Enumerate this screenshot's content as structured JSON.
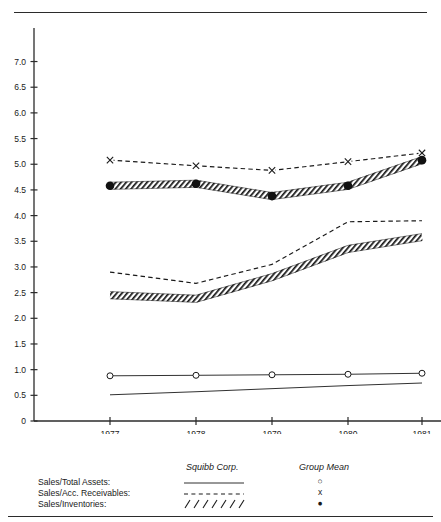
{
  "chart_data": {
    "type": "line",
    "title": "",
    "xlabel": "",
    "ylabel": "",
    "x": [
      "1977",
      "1978",
      "1979",
      "1980",
      "1981"
    ],
    "ylim": [
      0,
      7.4
    ],
    "yticks": [
      "0",
      "0.5",
      "1.0",
      "1.5",
      "2.0",
      "2.5",
      "3.0",
      "3.5",
      "4.0",
      "4.5",
      "5.0",
      "5.5",
      "6.0",
      "6.5",
      "7.0"
    ],
    "ytick_values": [
      0,
      0.5,
      1.0,
      1.5,
      2.0,
      2.5,
      3.0,
      3.5,
      4.0,
      4.5,
      5.0,
      5.5,
      6.0,
      6.5,
      7.0
    ],
    "grid": false,
    "legend_position": "below-plot",
    "series": [
      {
        "name": "Sales/Total Assets - Squibb Corp.",
        "style": "solid",
        "marker": "none",
        "entity": "Squibb Corp.",
        "metric": "Sales/Total Assets",
        "values": [
          0.51,
          0.57,
          0.63,
          0.69,
          0.74
        ]
      },
      {
        "name": "Sales/Total Assets - Group Mean",
        "style": "solid",
        "marker": "open-circle",
        "entity": "Group Mean",
        "metric": "Sales/Total Assets",
        "values": [
          0.88,
          0.89,
          0.9,
          0.91,
          0.93
        ]
      },
      {
        "name": "Sales/Acc. Receivables - Squibb Corp.",
        "style": "hatched",
        "marker": "none",
        "entity": "Squibb Corp.",
        "metric": "Sales/Acc. Receivables",
        "values": [
          2.45,
          2.38,
          2.8,
          3.35,
          3.58
        ]
      },
      {
        "name": "Sales/Acc. Receivables - Group Mean",
        "style": "dashed",
        "marker": "none",
        "entity": "Group Mean",
        "metric": "Sales/Acc. Receivables",
        "values": [
          2.9,
          2.68,
          3.05,
          3.88,
          3.9
        ]
      },
      {
        "name": "Sales/Inventories - Squibb Corp.",
        "style": "hatched",
        "marker": "none",
        "entity": "Squibb Corp.",
        "metric": "Sales/Inventories",
        "values": [
          4.58,
          4.62,
          4.38,
          4.58,
          5.08
        ]
      },
      {
        "name": "Sales/Inventories - Group Mean",
        "style": "dashed",
        "marker": "x",
        "entity": "Group Mean",
        "metric": "Sales/Inventories",
        "values": [
          5.08,
          4.97,
          4.88,
          5.05,
          5.22
        ]
      }
    ]
  },
  "legend": {
    "col_squibb": "Squibb Corp.",
    "col_group": "Group Mean",
    "rows": [
      {
        "label": "Sales/Total Assets:",
        "squibb_style": "solid",
        "group_marker": "○"
      },
      {
        "label": "Sales/Acc. Receivables:",
        "squibb_style": "dashed",
        "group_marker": "x"
      },
      {
        "label": "Sales/Inventories:",
        "squibb_style": "hatched",
        "group_marker": "●"
      }
    ]
  },
  "colors": {
    "ink": "#1a1a1a",
    "axis": "#2b2b2b",
    "background": "#ffffff"
  }
}
